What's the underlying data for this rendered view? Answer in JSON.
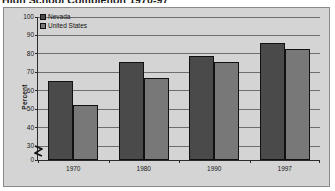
{
  "page": {
    "title": "High School Completion 1970-97"
  },
  "chart_data": {
    "type": "bar",
    "title": "High School Completion 1970-97",
    "xlabel": "",
    "ylabel": "Percent",
    "categories": [
      "1970",
      "1980",
      "1990",
      "1997"
    ],
    "series": [
      {
        "name": "Nevada",
        "color": "#4a4a4a",
        "values": [
          65.2,
          75.7,
          79.0,
          86.0
        ]
      },
      {
        "name": "United States",
        "color": "#787878",
        "values": [
          52.5,
          66.7,
          75.5,
          82.5
        ]
      }
    ],
    "ylim": [
      0,
      100
    ],
    "y_ticks": [
      0,
      30,
      40,
      50,
      60,
      70,
      80,
      90,
      100
    ],
    "y_axis_break": true,
    "y_break_between": [
      0,
      30
    ],
    "grid": true,
    "grid_axis": "y",
    "legend_position": "top-left"
  },
  "legend": {
    "entries": [
      {
        "label": "Nevada"
      },
      {
        "label": "United States"
      }
    ]
  },
  "axis": {
    "y_title": "Percent",
    "y_tick_labels": [
      "100",
      "90",
      "80",
      "70",
      "60",
      "50",
      "40",
      "30",
      "0"
    ],
    "x_tick_labels": [
      "1970",
      "1980",
      "1990",
      "1997"
    ]
  }
}
